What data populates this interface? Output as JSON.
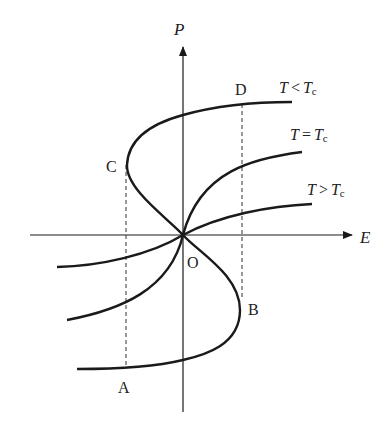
{
  "diagram": {
    "type": "hysteresis-P-E-curves",
    "axes": {
      "x_label": "E",
      "y_label": "P",
      "origin_label": "O"
    },
    "points": {
      "A": "A",
      "B": "B",
      "C": "C",
      "D": "D"
    },
    "curves": [
      {
        "id": "below-tc",
        "label_T": "T",
        "label_op": "<",
        "label_Tc": "T",
        "label_sub": "c"
      },
      {
        "id": "at-tc",
        "label_T": "T",
        "label_op": "=",
        "label_Tc": "T",
        "label_sub": "c"
      },
      {
        "id": "above-tc",
        "label_T": "T",
        "label_op": ">",
        "label_Tc": "T",
        "label_sub": "c"
      }
    ],
    "colors": {
      "line": "#1a1a1a",
      "text": "#222222",
      "background": "#ffffff"
    }
  }
}
